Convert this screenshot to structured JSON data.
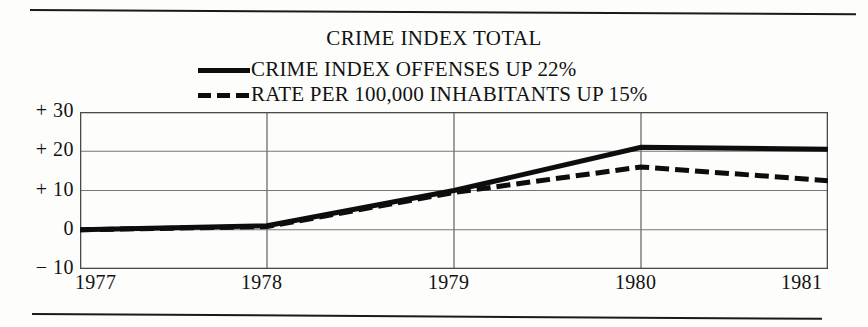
{
  "chart_data": {
    "type": "line",
    "title": "CRIME INDEX TOTAL",
    "xlabel": "",
    "ylabel": "",
    "grid": true,
    "legend_position": "top-center",
    "x": [
      1977,
      1978,
      1979,
      1980,
      1981
    ],
    "xticklabels": [
      "1977",
      "1978",
      "1979",
      "1980",
      "1981"
    ],
    "yticklabels": [
      "+ 30",
      "+ 20",
      "+ 10",
      "0",
      "− 10"
    ],
    "yticks": [
      30,
      20,
      10,
      0,
      -10
    ],
    "ylim": [
      -10,
      30
    ],
    "xlim": [
      1977,
      1981
    ],
    "series": [
      {
        "name": "CRIME INDEX OFFENSES UP 22%",
        "style": "solid",
        "color": "#0d0d0d",
        "values": [
          0,
          1,
          10,
          21,
          20.5
        ]
      },
      {
        "name": "RATE PER 100,000 INHABITANTS UP 15%",
        "style": "dashed",
        "color": "#0d0d0d",
        "values": [
          0,
          0.8,
          9.5,
          16,
          12.5
        ]
      }
    ]
  },
  "legend": {
    "items": [
      {
        "label": "CRIME INDEX OFFENSES UP 22%",
        "swatch": "solid-line-swatch"
      },
      {
        "label": "RATE PER 100,000 INHABITANTS UP 15%",
        "swatch": "dashed-line-swatch"
      }
    ]
  },
  "colors": {
    "ink": "#0d0d0d",
    "grid": "#767676",
    "frame": "#4a4a4a",
    "background": "#fdfdfc"
  }
}
